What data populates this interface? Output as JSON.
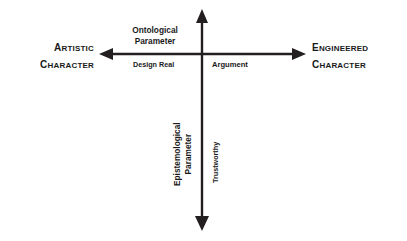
{
  "diagram": {
    "background_color": "#ffffff",
    "line_color": "#231f20",
    "text_color": "#1a1a1a",
    "axes": {
      "horizontal": {
        "name": "Ontological Parameter",
        "left_end_label": {
          "line1": "Artistic",
          "line2": "Character"
        },
        "right_end_label": {
          "line1": "Engineered",
          "line2": "Character"
        },
        "left_side_term": "Design Real",
        "right_side_term": "Argument"
      },
      "vertical": {
        "name_line1": "Epistemological",
        "name_line2": "Parameter",
        "side_term": "Trustworthy"
      }
    },
    "labels": {
      "ontological_line1": "Ontological",
      "ontological_line2": "Parameter",
      "design_real": "Design Real",
      "argument": "Argument",
      "epistemological_line1": "Epistemological",
      "epistemological_line2": "Parameter",
      "trustworthy": "Trustworthy"
    }
  }
}
